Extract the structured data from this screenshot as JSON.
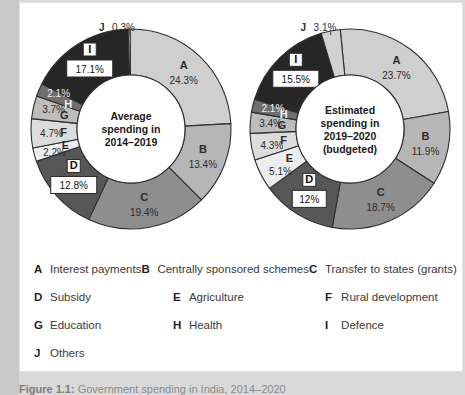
{
  "figure": {
    "caption_prefix": "Figure 1.1:",
    "caption_text": "Government spending in India, 2014–2020"
  },
  "legend": {
    "rows": [
      [
        {
          "key": "A",
          "label": "Interest payments"
        },
        {
          "key": "B",
          "label": "Centrally sponsored schemes"
        },
        {
          "key": "C",
          "label": "Transfer to states (grants)"
        }
      ],
      [
        {
          "key": "D",
          "label": "Subsidy"
        },
        {
          "key": "E",
          "label": "Agriculture"
        },
        {
          "key": "F",
          "label": "Rural development"
        }
      ],
      [
        {
          "key": "G",
          "label": "Education"
        },
        {
          "key": "H",
          "label": "Health"
        },
        {
          "key": "I",
          "label": "Defence"
        }
      ],
      [
        {
          "key": "J",
          "label": "Others"
        },
        {
          "key": "",
          "label": ""
        },
        {
          "key": "",
          "label": ""
        }
      ]
    ]
  },
  "colors": {
    "A": "#cfcfcf",
    "B": "#b6b6b6",
    "C": "#8e8e8e",
    "D": "#575757",
    "E": "#ededed",
    "F": "#dcdcdc",
    "G": "#bdbdbd",
    "H": "#6f6f6f",
    "I": "#262626",
    "J": "#d2d2d2",
    "stroke": "#2f2f2f",
    "hole": "#ffffff",
    "panel_bg": "#ffffff",
    "page_bg": "#d9d9d9"
  },
  "chart_data": [
    {
      "type": "pie",
      "title": "Average spending in 2014–2019",
      "title_lines": [
        "Average",
        "spending in",
        "2014–2019"
      ],
      "categories": [
        "A",
        "B",
        "C",
        "D",
        "E",
        "F",
        "G",
        "H",
        "I",
        "J"
      ],
      "values": [
        24.3,
        13.4,
        19.4,
        12.8,
        2.2,
        4.7,
        3.7,
        2.1,
        17.1,
        0.3
      ],
      "labels": [
        "24.3%",
        "13.4%",
        "19.4%",
        "12.8%",
        "2.2%",
        "4.7%",
        "3.7%",
        "2.1%",
        "17.1%",
        "0.3%"
      ],
      "callout": {
        "key": "J",
        "label": "0.3%"
      },
      "boxed_labels": [
        "D",
        "I"
      ],
      "legend_position": "below",
      "grid": false
    },
    {
      "type": "pie",
      "title": "Estimated spending in 2019–2020 (budgeted)",
      "title_lines": [
        "Estimated",
        "spending in",
        "2019–2020",
        "(budgeted)"
      ],
      "categories": [
        "A",
        "B",
        "C",
        "D",
        "E",
        "F",
        "G",
        "H",
        "I",
        "J"
      ],
      "values": [
        23.7,
        11.9,
        18.7,
        12.0,
        5.1,
        4.3,
        3.4,
        2.1,
        15.5,
        3.1
      ],
      "labels": [
        "23.7%",
        "11.9%",
        "18.7%",
        "12%",
        "5.1%",
        "4.3%",
        "3.4%",
        "2.1%",
        "15.5%",
        "3.1%"
      ],
      "callout": {
        "key": "J",
        "label": "3.1%"
      },
      "boxed_labels": [
        "D",
        "I"
      ],
      "legend_position": "below",
      "grid": false
    }
  ]
}
